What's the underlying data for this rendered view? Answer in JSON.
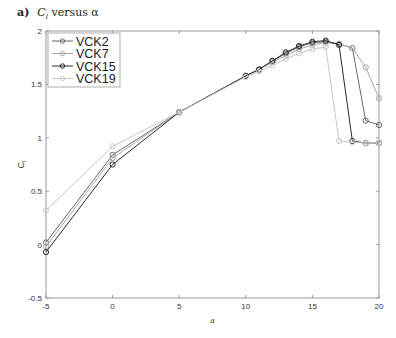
{
  "figure": {
    "panel_letter": "a)",
    "title_main": "C",
    "title_sub": "l",
    "title_rest": " versus α"
  },
  "chart_data": {
    "type": "line",
    "xlabel": "α",
    "ylabel": "C_l",
    "xlim": [
      -5,
      20
    ],
    "ylim": [
      -0.5,
      2
    ],
    "xticks": [
      -5,
      0,
      5,
      10,
      15,
      20
    ],
    "yticks": [
      -0.5,
      0,
      0.5,
      1,
      1.5,
      2
    ],
    "xtick_labels": [
      "-5",
      "0",
      "5",
      "10",
      "15",
      "20"
    ],
    "ytick_labels": [
      "-0.5",
      "0",
      "0.5",
      "1",
      "1.5",
      "2"
    ],
    "grid": false,
    "legend_position": "upper left",
    "series": [
      {
        "name": "VCK2",
        "color": "#6a6a6a",
        "x": [
          -5,
          0,
          5,
          10,
          11,
          12,
          13,
          14,
          15,
          16,
          17,
          18,
          19,
          20
        ],
        "y": [
          0.02,
          0.84,
          1.24,
          1.58,
          1.64,
          1.72,
          1.79,
          1.85,
          1.89,
          1.9,
          1.88,
          1.84,
          1.16,
          1.12
        ]
      },
      {
        "name": "VCK7",
        "color": "#a8a8a8",
        "x": [
          -5,
          0,
          5,
          10,
          11,
          12,
          13,
          14,
          15,
          16,
          17,
          18,
          19,
          20
        ],
        "y": [
          -0.02,
          0.81,
          1.24,
          1.58,
          1.64,
          1.71,
          1.77,
          1.83,
          1.87,
          1.89,
          1.88,
          1.84,
          1.66,
          1.37
        ]
      },
      {
        "name": "VCK15",
        "color": "#2a2a2a",
        "x": [
          -5,
          0,
          5,
          10,
          11,
          12,
          13,
          14,
          15,
          16,
          17,
          18,
          19,
          20
        ],
        "y": [
          -0.07,
          0.75,
          1.24,
          1.58,
          1.64,
          1.72,
          1.8,
          1.86,
          1.9,
          1.91,
          1.87,
          0.97,
          0.95,
          0.95
        ]
      },
      {
        "name": "VCK19",
        "color": "#c8c8c8",
        "x": [
          -5,
          0,
          5,
          10,
          11,
          12,
          13,
          14,
          15,
          16,
          17,
          18,
          19,
          20
        ],
        "y": [
          0.32,
          0.92,
          1.24,
          1.57,
          1.62,
          1.68,
          1.74,
          1.79,
          1.83,
          1.85,
          0.97,
          0.96,
          0.95,
          0.95
        ]
      }
    ]
  }
}
